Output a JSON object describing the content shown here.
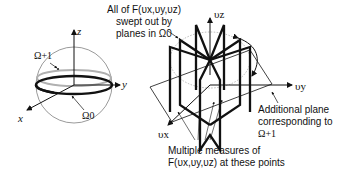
{
  "left_panel": {
    "axis_z": "z",
    "axis_y": "y",
    "axis_x": "x",
    "omega_plus_label": "Ω+1",
    "omega_zero_label": "Ω0"
  },
  "right_panel": {
    "axis_vz": "υz",
    "axis_vy": "υy",
    "axis_vx": "υx",
    "top_annotation": {
      "line1": "All of F(υx,υy,υz)",
      "line2": "swept out by",
      "line3": "planes in Ω0"
    },
    "side_annotation": {
      "line1": "Additional plane",
      "line2": "corresponding to",
      "line3": "Ω+1"
    },
    "bottom_annotation": {
      "line1": "Multiple measures of",
      "line2": "F(υx,υy,υz) at these points"
    }
  },
  "colors": {
    "line": "#111111",
    "gray_ring": "#b0b0b0",
    "sphere": "#555555",
    "dotted": "#999999"
  }
}
